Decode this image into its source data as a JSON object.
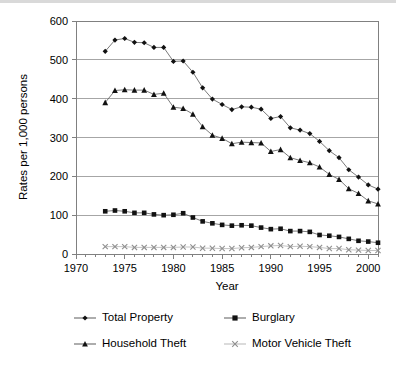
{
  "chart_data": {
    "type": "line",
    "title": "",
    "xlabel": "Year",
    "ylabel": "Rates per 1,000 persons",
    "xlim": [
      1970,
      2001
    ],
    "ylim": [
      0,
      600
    ],
    "yticks": [
      0,
      100,
      200,
      300,
      400,
      500,
      600
    ],
    "xticks": [
      1970,
      1975,
      1980,
      1985,
      1990,
      1995,
      2000
    ],
    "xticklabels": [
      "1970",
      "1975",
      "1980",
      "1985",
      "1990",
      "1995",
      "2000"
    ],
    "yticklabels": [
      "0",
      "100",
      "200",
      "300",
      "400",
      "500",
      "600"
    ],
    "grid": "horizontal",
    "legend_position": "bottom",
    "x": [
      1973,
      1974,
      1975,
      1976,
      1977,
      1978,
      1979,
      1980,
      1981,
      1982,
      1983,
      1984,
      1985,
      1986,
      1987,
      1988,
      1989,
      1990,
      1991,
      1992,
      1993,
      1994,
      1995,
      1996,
      1997,
      1998,
      1999,
      2000,
      2001
    ],
    "series": [
      {
        "name": "Total Property",
        "marker": "diamond",
        "color": "#111111",
        "line_color": "#6b6b6b",
        "values": [
          522,
          551,
          555,
          545,
          544,
          532,
          532,
          496,
          497,
          468,
          428,
          399,
          385,
          372,
          379,
          378,
          373,
          349,
          354,
          325,
          319,
          310,
          290,
          266,
          248,
          217,
          198,
          178,
          167
        ]
      },
      {
        "name": "Burglary",
        "marker": "square",
        "color": "#111111",
        "line_color": "#6b6b6b",
        "values": [
          110,
          112,
          110,
          106,
          106,
          102,
          100,
          101,
          105,
          94,
          84,
          79,
          75,
          73,
          74,
          73,
          68,
          64,
          65,
          59,
          59,
          57,
          49,
          47,
          44,
          39,
          34,
          32,
          29
        ]
      },
      {
        "name": "Household Theft",
        "marker": "triangle",
        "color": "#111111",
        "line_color": "#6b6b6b",
        "values": [
          390,
          421,
          423,
          422,
          422,
          411,
          414,
          378,
          375,
          360,
          328,
          306,
          298,
          284,
          288,
          287,
          286,
          264,
          269,
          248,
          241,
          235,
          224,
          205,
          192,
          168,
          156,
          137,
          129
        ]
      },
      {
        "name": "Motor Vehicle Theft",
        "marker": "x",
        "color": "#8f8f8f",
        "line_color": "#bdbdbd",
        "values": [
          19,
          19,
          19,
          17,
          17,
          17,
          17,
          17,
          18,
          18,
          15,
          15,
          14,
          14,
          16,
          17,
          19,
          21,
          22,
          19,
          20,
          19,
          17,
          14,
          14,
          11,
          10,
          9,
          9
        ]
      }
    ]
  },
  "legend": {
    "entries": [
      {
        "label": "Total Property",
        "marker": "diamond"
      },
      {
        "label": "Burglary",
        "marker": "square"
      },
      {
        "label": "Household Theft",
        "marker": "triangle"
      },
      {
        "label": "Motor Vehicle Theft",
        "marker": "x"
      }
    ]
  }
}
